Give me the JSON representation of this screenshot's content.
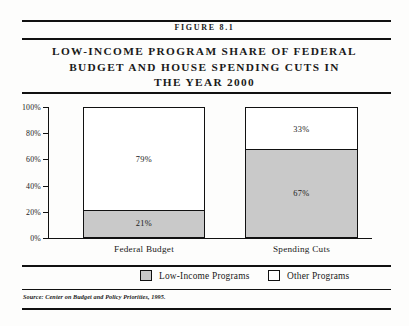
{
  "figure": {
    "number_label": "FIGURE 8.1",
    "title_lines": [
      "LOW-INCOME PROGRAM SHARE OF FEDERAL",
      "BUDGET AND HOUSE SPENDING CUTS IN",
      "THE YEAR 2000"
    ],
    "source_note": "Source: Center on Budget and Policy Priorities, 1995."
  },
  "legend": {
    "items": [
      {
        "label": "Low-Income Programs",
        "swatch_color": "#c9c9c9"
      },
      {
        "label": "Other Programs",
        "swatch_color": "#ffffff"
      }
    ]
  },
  "chart_data": {
    "type": "bar",
    "subtype": "stacked-100",
    "title": "LOW-INCOME PROGRAM SHARE OF FEDERAL BUDGET AND HOUSE SPENDING CUTS IN THE YEAR 2000",
    "xlabel": "",
    "ylabel": "",
    "ylim": [
      0,
      100
    ],
    "yticks": [
      0,
      20,
      40,
      60,
      80,
      100
    ],
    "ytick_labels": [
      "0%",
      "20%",
      "40%",
      "60%",
      "80%",
      "100%"
    ],
    "grid": false,
    "legend_position": "bottom",
    "categories": [
      "Federal Budget",
      "Spending Cuts"
    ],
    "series": [
      {
        "name": "Low-Income Programs",
        "color": "#c9c9c9",
        "values": [
          21,
          67
        ],
        "data_labels": [
          "21%",
          "67%"
        ]
      },
      {
        "name": "Other Programs",
        "color": "#ffffff",
        "values": [
          79,
          33
        ],
        "data_labels": [
          "79%",
          "33%"
        ]
      }
    ]
  }
}
